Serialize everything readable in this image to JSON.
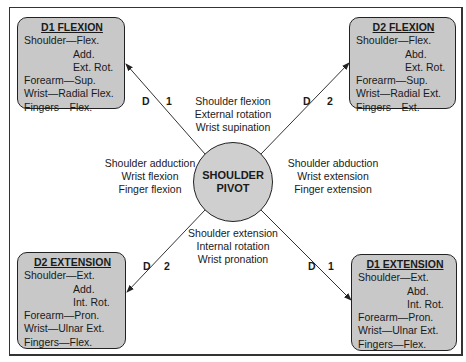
{
  "diagram": {
    "center": {
      "line1": "SHOULDER",
      "line2": "PIVOT"
    },
    "boxes": {
      "d1_flexion": {
        "title": "D1 FLEXION",
        "rows": [
          "Shoulder—Flex.",
          "Add.",
          "Ext. Rot.",
          "Forearm—Sup.",
          "Wrist—Radial Flex.",
          "Fingers—Flex."
        ]
      },
      "d2_flexion": {
        "title": "D2 FLEXION",
        "rows": [
          "Shoulder—Flex.",
          "Abd.",
          "Ext. Rot.",
          "Forearm—Sup.",
          "Wrist—Radial Ext.",
          "Fingers—Ext."
        ]
      },
      "d2_extension": {
        "title": "D2 EXTENSION",
        "rows": [
          "Shoulder—Ext.",
          "Add.",
          "Int. Rot.",
          "Forearm—Pron.",
          "Wrist—Ulnar Ext.",
          "Fingers—Flex."
        ]
      },
      "d1_extension": {
        "title": "D1 EXTENSION",
        "rows": [
          "Shoulder—Ext.",
          "Abd.",
          "Int. Rot.",
          "Forearm—Pron.",
          "Wrist—Ulnar Ext.",
          "Fingers—Flex."
        ]
      }
    },
    "motions": {
      "top": [
        "Shoulder flexion",
        "External rotation",
        "Wrist supination"
      ],
      "left": [
        "Shoulder adduction",
        "Wrist flexion",
        "Finger flexion"
      ],
      "right": [
        "Shoulder abduction",
        "Wrist extension",
        "Finger extension"
      ],
      "bottom": [
        "Shoulder extension",
        "Internal rotation",
        "Wrist pronation"
      ]
    },
    "diagonal_labels": {
      "top_left": {
        "d": "D",
        "n": "1"
      },
      "top_right": {
        "d": "D",
        "n": "2"
      },
      "bottom_left": {
        "d": "D",
        "n": "2"
      },
      "bottom_right": {
        "d": "D",
        "n": "1"
      }
    },
    "colors": {
      "box_fill": "#c8c8c8",
      "circle_fill": "#cfcfcf",
      "line": "#333333"
    }
  }
}
